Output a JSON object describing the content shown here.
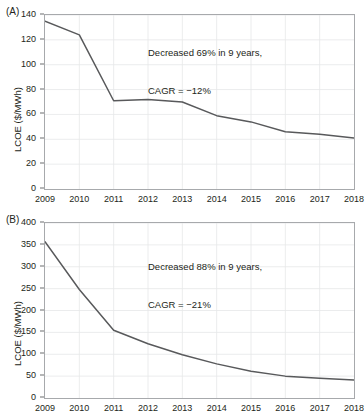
{
  "figure": {
    "axis_color": "#a7a9ac",
    "line_color": "#58595b",
    "grid_color": "#e6e7e8",
    "text_color": "#231f20"
  },
  "panels": [
    {
      "id": "A",
      "label": "(A)",
      "ylabel": "LCOE ($/MWh)",
      "annotation_line1": "Decreased 69% in 9 years,",
      "annotation_line2": "CAGR = −12%"
    },
    {
      "id": "B",
      "label": "(B)",
      "ylabel": "LCOE ($/MWh)",
      "annotation_line1": "Decreased 88% in 9 years,",
      "annotation_line2": "CAGR = −21%"
    }
  ],
  "chart_data": [
    {
      "type": "line",
      "panel": "A",
      "title": "",
      "xlabel": "",
      "ylabel": "LCOE ($/MWh)",
      "x": [
        2009,
        2010,
        2011,
        2012,
        2013,
        2014,
        2015,
        2016,
        2017,
        2018
      ],
      "xticklabels": [
        "2009",
        "2010",
        "2011",
        "2012",
        "2013",
        "2014",
        "2015",
        "2016",
        "2017",
        "2018"
      ],
      "values": [
        135,
        124,
        71,
        72,
        70,
        59,
        54,
        46,
        44,
        41
      ],
      "yticks": [
        0,
        20,
        40,
        60,
        80,
        100,
        120,
        140
      ],
      "yticklabels": [
        "0",
        "20",
        "40",
        "60",
        "80",
        "100",
        "120",
        "140"
      ],
      "xlim": [
        2009,
        2018
      ],
      "ylim": [
        0,
        140
      ],
      "grid": true,
      "legend": "none",
      "annotations": [
        "Decreased 69% in 9 years,",
        "CAGR = −12%"
      ]
    },
    {
      "type": "line",
      "panel": "B",
      "title": "",
      "xlabel": "",
      "ylabel": "LCOE ($/MWh)",
      "x": [
        2009,
        2010,
        2011,
        2012,
        2013,
        2014,
        2015,
        2016,
        2017,
        2018
      ],
      "xticklabels": [
        "2009",
        "2010",
        "2011",
        "2012",
        "2013",
        "2014",
        "2015",
        "2016",
        "2017",
        "2018"
      ],
      "values": [
        357,
        248,
        155,
        124,
        99,
        78,
        61,
        50,
        45,
        41
      ],
      "yticks": [
        0,
        50,
        100,
        150,
        200,
        250,
        300,
        350,
        400
      ],
      "yticklabels": [
        "0",
        "50",
        "100",
        "150",
        "200",
        "250",
        "300",
        "350",
        "400"
      ],
      "xlim": [
        2009,
        2018
      ],
      "ylim": [
        0,
        400
      ],
      "grid": true,
      "legend": "none",
      "annotations": [
        "Decreased 88% in 9 years,",
        "CAGR = −21%"
      ]
    }
  ]
}
